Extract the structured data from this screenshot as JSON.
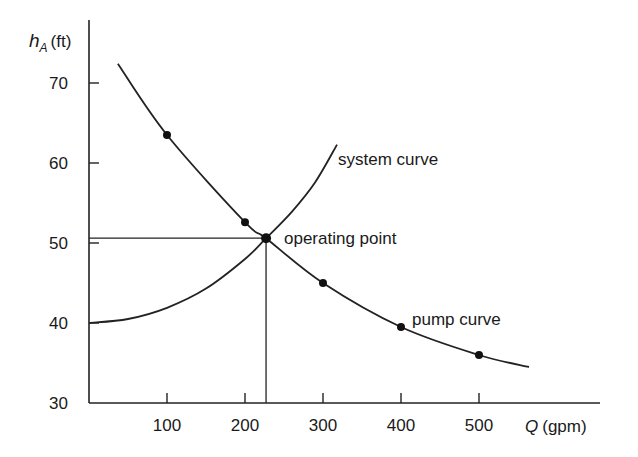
{
  "chart_data": {
    "type": "line",
    "title": "",
    "xlabel": "Q (gpm)",
    "xlabel_var": "Q",
    "xlabel_unit": "(gpm)",
    "ylabel": "h_A (ft)",
    "ylabel_var": "h",
    "ylabel_sub": "A",
    "ylabel_unit": "(ft)",
    "xlim": [
      0,
      600
    ],
    "ylim": [
      30,
      72
    ],
    "x_ticks": [
      100,
      200,
      300,
      400,
      500
    ],
    "y_ticks": [
      30,
      40,
      50,
      60,
      70
    ],
    "grid": false,
    "legend": "none (inline annotations)",
    "series": [
      {
        "name": "pump curve",
        "marker_points": {
          "x": [
            100,
            200,
            300,
            400,
            500
          ],
          "y": [
            63.5,
            52.6,
            45.0,
            39.5,
            36.0
          ]
        },
        "curve": {
          "x": [
            37,
            100,
            200,
            227,
            300,
            400,
            500,
            564
          ],
          "y": [
            72.4,
            63.5,
            52.6,
            50.6,
            45.0,
            39.5,
            36.0,
            34.5
          ]
        }
      },
      {
        "name": "system curve",
        "curve": {
          "x": [
            0,
            50,
            100,
            150,
            200,
            227,
            260,
            290,
            318
          ],
          "y": [
            40.0,
            40.5,
            41.9,
            44.3,
            48.0,
            50.6,
            53.9,
            57.6,
            62.3
          ]
        }
      }
    ],
    "annotations": [
      {
        "text": "system curve",
        "x": 320,
        "y": 61
      },
      {
        "text": "operating point",
        "x": 227,
        "y": 50.6
      },
      {
        "text": "pump curve",
        "x": 400,
        "y": 39.5
      }
    ],
    "operating_point": {
      "Q": 227,
      "h": 50.6
    }
  },
  "labels": {
    "system_curve": "system curve",
    "operating_point": "operating point",
    "pump_curve": "pump curve"
  }
}
